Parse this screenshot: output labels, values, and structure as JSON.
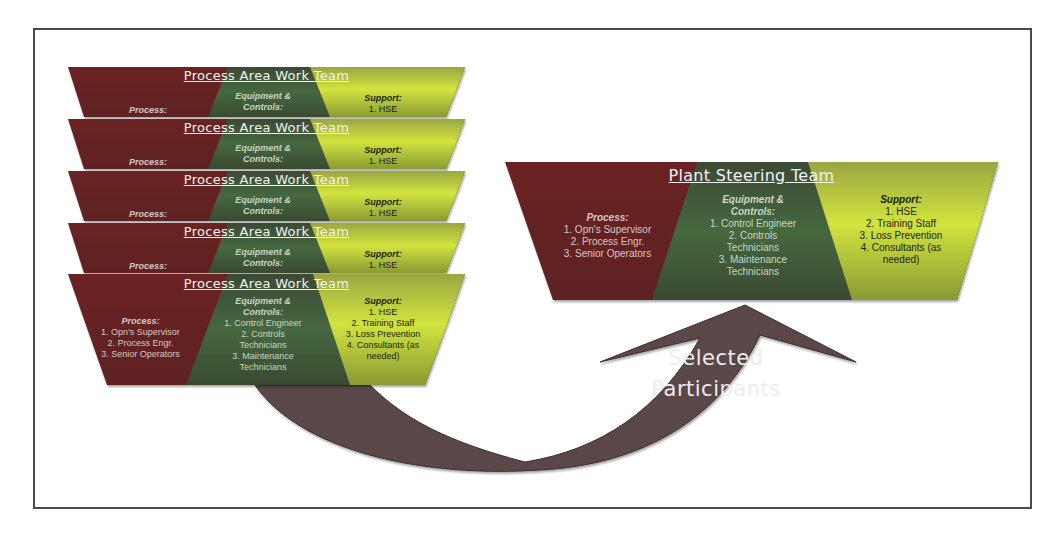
{
  "colors": {
    "frame_border": "#4a4a4a",
    "process": "#6e2222",
    "equipment": "#3f5f38",
    "support": "#c6dc3c",
    "arrow": "#5a4646"
  },
  "work_teams": {
    "title": "Process Area Work Team",
    "count": 5,
    "collapsed": {
      "process_header": "Process:",
      "equipment_header": "Equipment & Controls:",
      "support_header": "Support:",
      "support_items": [
        "1. HSE"
      ]
    },
    "expanded": {
      "process_header": "Process:",
      "process_items": [
        "1. Opn's Supervisor",
        "2. Process Engr.",
        "3. Senior Operators"
      ],
      "equipment_header": "Equipment & Controls:",
      "equipment_items": [
        "1. Control Engineer",
        "2. Controls Technicians",
        "3. Maintenance Technicians"
      ],
      "support_header": "Support:",
      "support_items": [
        "1. HSE",
        "2. Training Staff",
        "3. Loss Prevention",
        "4. Consultants (as needed)"
      ]
    }
  },
  "steering_team": {
    "title": "Plant Steering Team",
    "process_header": "Process:",
    "process_items": [
      "1. Opn's Supervisor",
      "2. Process Engr.",
      "3. Senior Operators"
    ],
    "equipment_header": "Equipment & Controls:",
    "equipment_items": [
      "1. Control Engineer",
      "2. Controls Technicians",
      "3. Maintenance Technicians"
    ],
    "support_header": "Support:",
    "support_items": [
      "1. HSE",
      "2. Training Staff",
      "3. Loss Prevention",
      "4. Consultants (as needed)"
    ]
  },
  "arrow": {
    "label_line1": "Selected",
    "label_line2": "Participants"
  }
}
